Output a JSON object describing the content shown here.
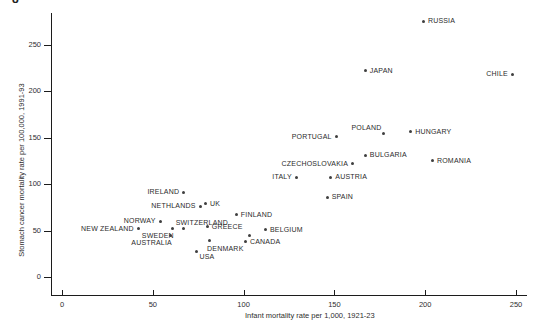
{
  "figure": {
    "corner_glyph": "8"
  },
  "colors": {
    "marker": "#3f3f3f",
    "axis": "#1c1c1c",
    "text": "#2e2e2e"
  },
  "chart_data": {
    "type": "scatter",
    "title": "",
    "xlabel": "Infant mortality rate per 1,000, 1921-23",
    "ylabel": "Stomach cancer mortality rate per 100,000, 1991-93",
    "xlim": [
      0,
      250
    ],
    "ylim": [
      0,
      275
    ],
    "grid": false,
    "legend": "none",
    "x_ticks": [
      0,
      50,
      100,
      150,
      200,
      250
    ],
    "y_ticks": [
      0,
      50,
      100,
      150,
      200,
      250
    ],
    "points": [
      {
        "label": "RUSSIA",
        "x": 199,
        "y": 275,
        "label_side": "right"
      },
      {
        "label": "JAPAN",
        "x": 167,
        "y": 222,
        "label_side": "right"
      },
      {
        "label": "CHILE",
        "x": 248,
        "y": 218,
        "label_side": "left"
      },
      {
        "label": "HUNGARY",
        "x": 192,
        "y": 156,
        "label_side": "right"
      },
      {
        "label": "POLAND",
        "x": 177,
        "y": 154,
        "label_side": "above-left"
      },
      {
        "label": "PORTUGAL",
        "x": 151,
        "y": 151,
        "label_side": "left"
      },
      {
        "label": "BULGARIA",
        "x": 167,
        "y": 131,
        "label_side": "right"
      },
      {
        "label": "ROMANIA",
        "x": 204,
        "y": 125,
        "label_side": "right"
      },
      {
        "label": "CZECHOSLOVAKIA",
        "x": 160,
        "y": 122,
        "label_side": "left"
      },
      {
        "label": "ITALY",
        "x": 129,
        "y": 107,
        "label_side": "left"
      },
      {
        "label": "AUSTRIA",
        "x": 148,
        "y": 107,
        "label_side": "right"
      },
      {
        "label": "SPAIN",
        "x": 146,
        "y": 86,
        "label_side": "right"
      },
      {
        "label": "IRELAND",
        "x": 67,
        "y": 91,
        "label_side": "left"
      },
      {
        "label": "UK",
        "x": 79,
        "y": 79,
        "label_side": "right"
      },
      {
        "label": "NETHLANDS",
        "x": 76,
        "y": 76,
        "label_side": "left"
      },
      {
        "label": "FINLAND",
        "x": 96,
        "y": 67,
        "label_side": "right"
      },
      {
        "label": "NORWAY",
        "x": 54,
        "y": 60,
        "label_side": "left"
      },
      {
        "label": "SWITZERLAND",
        "x": 67,
        "y": 52,
        "label_side": "above"
      },
      {
        "label": "SWEDEN",
        "x": 61,
        "y": 52,
        "label_side": "below-left"
      },
      {
        "label": "GREECE",
        "x": 80,
        "y": 54,
        "label_side": "right"
      },
      {
        "label": "NEW ZEALAND",
        "x": 42,
        "y": 52,
        "label_side": "left"
      },
      {
        "label": "BELGIUM",
        "x": 112,
        "y": 51,
        "label_side": "right"
      },
      {
        "label": "AUSTRALIA",
        "x": 60,
        "y": 45,
        "label_side": "below-left"
      },
      {
        "label": "",
        "x": 103,
        "y": 45,
        "label_side": "right"
      },
      {
        "label": "DENMARK",
        "x": 81,
        "y": 39,
        "label_side": "below"
      },
      {
        "label": "CANADA",
        "x": 101,
        "y": 38,
        "label_side": "right"
      },
      {
        "label": "USA",
        "x": 74,
        "y": 27,
        "label_side": "below-right"
      }
    ]
  }
}
